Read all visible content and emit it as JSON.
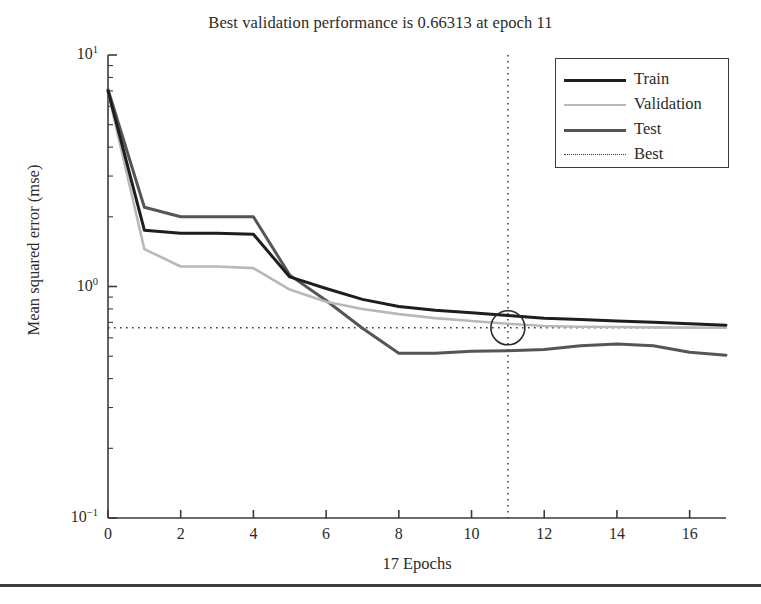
{
  "title": "Best validation performance is 0.66313 at epoch 11",
  "axes": {
    "xlabel": "17 Epochs",
    "ylabel": "Mean squared error (mse)",
    "xticks": [
      "0",
      "2",
      "4",
      "6",
      "8",
      "10",
      "12",
      "14",
      "16"
    ],
    "yticks": [
      {
        "mantissa": "10",
        "exp": "1"
      },
      {
        "mantissa": "10",
        "exp": "0"
      },
      {
        "mantissa": "10",
        "exp": "-1"
      }
    ]
  },
  "legend": {
    "items": [
      {
        "label": "Train",
        "style": "solid",
        "color": "#1e1e1e",
        "width": 3.0
      },
      {
        "label": "Validation",
        "style": "solid",
        "color": "#b8b8b8",
        "width": 2.6
      },
      {
        "label": "Test",
        "style": "solid",
        "color": "#555555",
        "width": 3.0
      },
      {
        "label": "Best",
        "style": "dotted",
        "color": "#3a3a3a",
        "width": 1.4
      }
    ]
  },
  "colors": {
    "train": "#1e1e1e",
    "validation": "#b8b8b8",
    "test": "#555555",
    "best": "#3a3a3a",
    "axis": "#3a3a3a",
    "background": "#ffffff"
  },
  "chart_data": {
    "type": "line",
    "title": "Best validation performance is 0.66313 at epoch 11",
    "xlabel": "17 Epochs",
    "ylabel": "Mean squared error (mse)",
    "yscale": "log",
    "xlim": [
      0,
      17
    ],
    "ylim": [
      0.1,
      10
    ],
    "grid": false,
    "legend_position": "top-right",
    "x": [
      0,
      1,
      2,
      3,
      4,
      5,
      6,
      7,
      8,
      9,
      10,
      11,
      12,
      13,
      14,
      15,
      16,
      17
    ],
    "series": [
      {
        "name": "Train",
        "color": "#1e1e1e",
        "values": [
          7.0,
          1.75,
          1.7,
          1.7,
          1.68,
          1.1,
          0.98,
          0.88,
          0.82,
          0.79,
          0.77,
          0.75,
          0.73,
          0.72,
          0.71,
          0.7,
          0.69,
          0.68
        ]
      },
      {
        "name": "Validation",
        "color": "#b8b8b8",
        "values": [
          6.9,
          1.45,
          1.22,
          1.22,
          1.2,
          0.97,
          0.86,
          0.8,
          0.76,
          0.73,
          0.71,
          0.69,
          0.675,
          0.67,
          0.668,
          0.666,
          0.664,
          0.663
        ]
      },
      {
        "name": "Test",
        "color": "#555555",
        "values": [
          7.1,
          2.2,
          2.0,
          2.0,
          2.0,
          1.12,
          0.87,
          0.66,
          0.515,
          0.515,
          0.525,
          0.528,
          0.535,
          0.555,
          0.565,
          0.555,
          0.52,
          0.505
        ]
      }
    ],
    "annotations": {
      "best_value": 0.66313,
      "best_epoch": 11,
      "best_hline": {
        "y": 0.66313,
        "style": "dotted"
      },
      "best_vline": {
        "x": 11,
        "style": "dotted"
      },
      "best_marker": {
        "x": 11,
        "y": 0.66313,
        "shape": "circle",
        "filled": false,
        "radius_px": 17
      }
    }
  }
}
